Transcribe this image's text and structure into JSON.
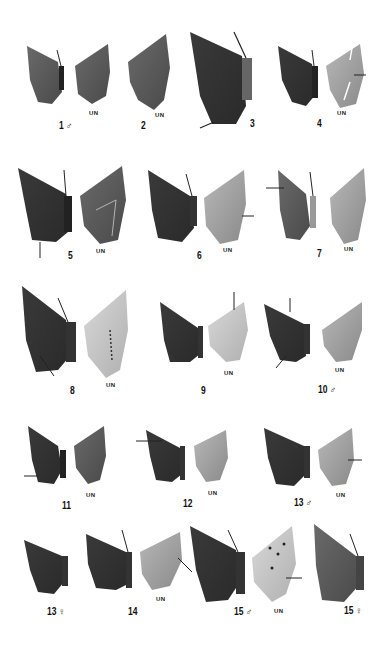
{
  "plate": {
    "background": "#ffffff",
    "underside_label": "UN",
    "figures": [
      {
        "id": "1",
        "label": "1 ♂",
        "has_underside": true
      },
      {
        "id": "2",
        "label": "2",
        "has_underside": true
      },
      {
        "id": "3",
        "label": "3",
        "has_underside": false
      },
      {
        "id": "4",
        "label": "4",
        "has_underside": true
      },
      {
        "id": "5",
        "label": "5",
        "has_underside": true
      },
      {
        "id": "6",
        "label": "6",
        "has_underside": true
      },
      {
        "id": "7",
        "label": "7",
        "has_underside": true
      },
      {
        "id": "8",
        "label": "8",
        "has_underside": true
      },
      {
        "id": "9",
        "label": "9",
        "has_underside": true
      },
      {
        "id": "10",
        "label": "10 ♂",
        "has_underside": true
      },
      {
        "id": "11",
        "label": "11",
        "has_underside": true
      },
      {
        "id": "12",
        "label": "12",
        "has_underside": true
      },
      {
        "id": "13m",
        "label": "13 ♂",
        "has_underside": true
      },
      {
        "id": "13f",
        "label": "13 ♀",
        "has_underside": false
      },
      {
        "id": "14",
        "label": "14",
        "has_underside": true
      },
      {
        "id": "15m",
        "label": "15 ♂",
        "has_underside": true
      },
      {
        "id": "15f",
        "label": "15 ♀",
        "has_underside": false
      }
    ]
  }
}
